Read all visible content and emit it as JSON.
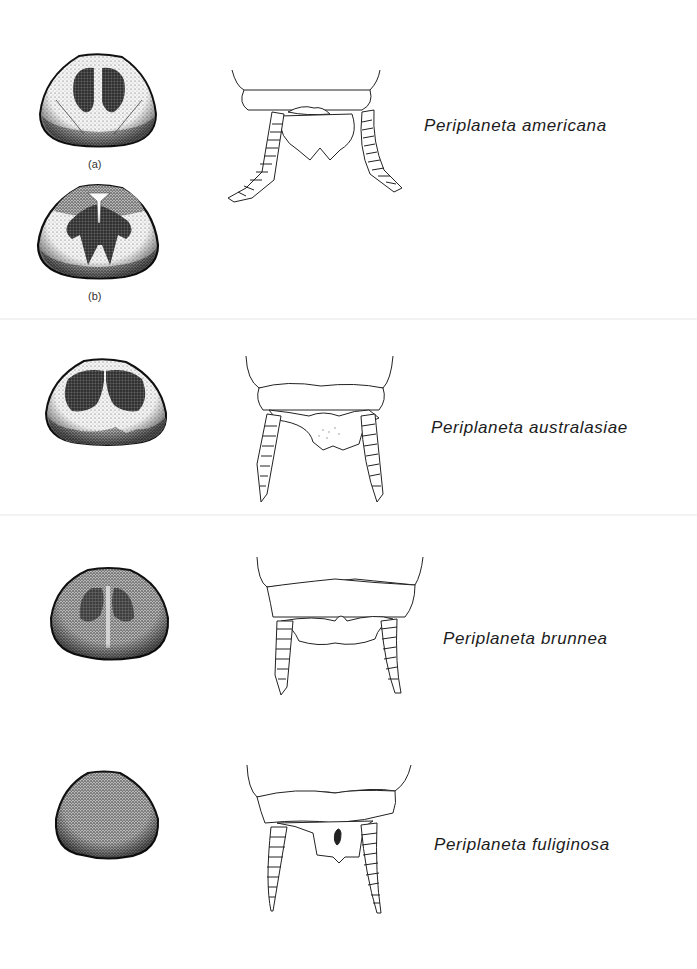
{
  "figure": {
    "rows": [
      {
        "species": "Periplaneta americana",
        "pronotum_variants": [
          {
            "label": "(a)"
          },
          {
            "label": "(b)"
          }
        ]
      },
      {
        "species": "Periplaneta australasiae",
        "pronotum_variants": []
      },
      {
        "species": "Periplaneta brunnea",
        "pronotum_variants": []
      },
      {
        "species": "Periplaneta fuliginosa",
        "pronotum_variants": []
      }
    ],
    "colors": {
      "ink": "#1a1a1a",
      "stipple_dark": "#2a2a2a",
      "stipple_light": "#d8d8d8",
      "paper": "#ffffff"
    }
  }
}
